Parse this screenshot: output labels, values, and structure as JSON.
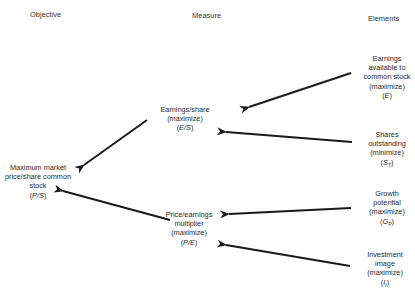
{
  "headers": {
    "objective": "Objective",
    "measure": "Measure",
    "elements": "Elements"
  },
  "objective": {
    "lines": [
      "Maximum market",
      "price/share common",
      "stock"
    ],
    "symbol": "P/S"
  },
  "measures": [
    {
      "id": "eps",
      "lines": [
        "Earnings/share",
        "(maximize)"
      ],
      "symbol": "E/S"
    },
    {
      "id": "pe",
      "lines": [
        "Price/earnings",
        "multiplier",
        "(maximize)"
      ],
      "symbol": "P/E"
    }
  ],
  "elements": [
    {
      "id": "earnings",
      "lines": [
        "Earnings",
        "available to",
        "common stock",
        "(maximize)"
      ],
      "symbol": "E",
      "subscript": ""
    },
    {
      "id": "shares",
      "lines": [
        "Shares",
        "outstanding",
        "(minimize)"
      ],
      "symbol": "S",
      "subscript": "T"
    },
    {
      "id": "growth",
      "lines": [
        "Growth",
        "potential",
        "(maximize)"
      ],
      "symbol": "G",
      "subscript": "P"
    },
    {
      "id": "image",
      "lines": [
        "Investment",
        "image",
        "(maximize)"
      ],
      "symbol": "I",
      "subscript": "I"
    }
  ],
  "arrows": [
    {
      "from": "earnings",
      "to": "eps"
    },
    {
      "from": "shares",
      "to": "eps"
    },
    {
      "from": "eps",
      "to": "objective"
    },
    {
      "from": "pe",
      "to": "objective"
    },
    {
      "from": "growth",
      "to": "pe"
    },
    {
      "from": "image",
      "to": "pe"
    }
  ]
}
